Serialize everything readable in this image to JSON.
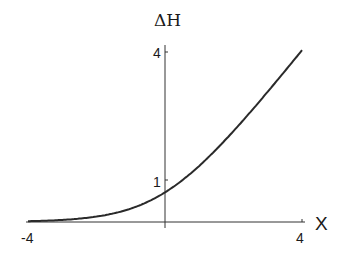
{
  "chart_data": {
    "type": "line",
    "title": "",
    "xlabel": "X",
    "ylabel": "ΔH",
    "xlim": [
      -4,
      4
    ],
    "ylim": [
      0,
      4
    ],
    "x_ticks": [
      "-4",
      "4"
    ],
    "y_ticks": [
      "1",
      "4"
    ],
    "grid": false,
    "legend": null,
    "series": [
      {
        "name": "ΔH(X)",
        "x": [
          -4,
          -3,
          -2,
          -1,
          0,
          1,
          2,
          3,
          4
        ],
        "values": [
          0.02,
          0.05,
          0.13,
          0.31,
          0.69,
          1.31,
          2.13,
          3.05,
          4.02
        ]
      }
    ]
  },
  "labels": {
    "y_axis": "ΔH",
    "x_axis": "X",
    "x_tick_min": "-4",
    "x_tick_max": "4",
    "y_tick_1": "1",
    "y_tick_4": "4"
  }
}
